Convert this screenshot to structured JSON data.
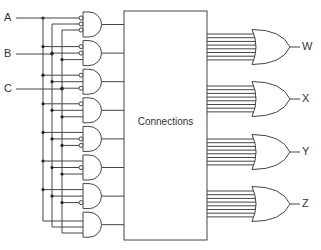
{
  "colors": {
    "stroke": "#444444",
    "background": "#ffffff",
    "text": "#333333"
  },
  "inputs": [
    {
      "label": "A",
      "y": 18,
      "bus_x": 43
    },
    {
      "label": "B",
      "y": 54,
      "bus_x": 52
    },
    {
      "label": "C",
      "y": 89,
      "bus_x": 62
    }
  ],
  "and_gates": [
    {
      "minterm": "A'B'C'",
      "inverted": [
        true,
        true,
        true
      ]
    },
    {
      "minterm": "A'B'C",
      "inverted": [
        true,
        true,
        false
      ]
    },
    {
      "minterm": "A'BC'",
      "inverted": [
        true,
        false,
        true
      ]
    },
    {
      "minterm": "A'BC",
      "inverted": [
        true,
        false,
        false
      ]
    },
    {
      "minterm": "AB'C'",
      "inverted": [
        false,
        true,
        true
      ]
    },
    {
      "minterm": "AB'C",
      "inverted": [
        false,
        true,
        false
      ]
    },
    {
      "minterm": "ABC'",
      "inverted": [
        false,
        false,
        true
      ]
    },
    {
      "minterm": "ABC",
      "inverted": [
        false,
        false,
        false
      ]
    }
  ],
  "connections_box": {
    "label": "Connections"
  },
  "or_gates": [
    {
      "label": "W",
      "center_y": 47
    },
    {
      "label": "X",
      "center_y": 99
    },
    {
      "label": "Y",
      "center_y": 152
    },
    {
      "label": "Z",
      "center_y": 204
    }
  ],
  "or_inputs_per_gate": 8
}
